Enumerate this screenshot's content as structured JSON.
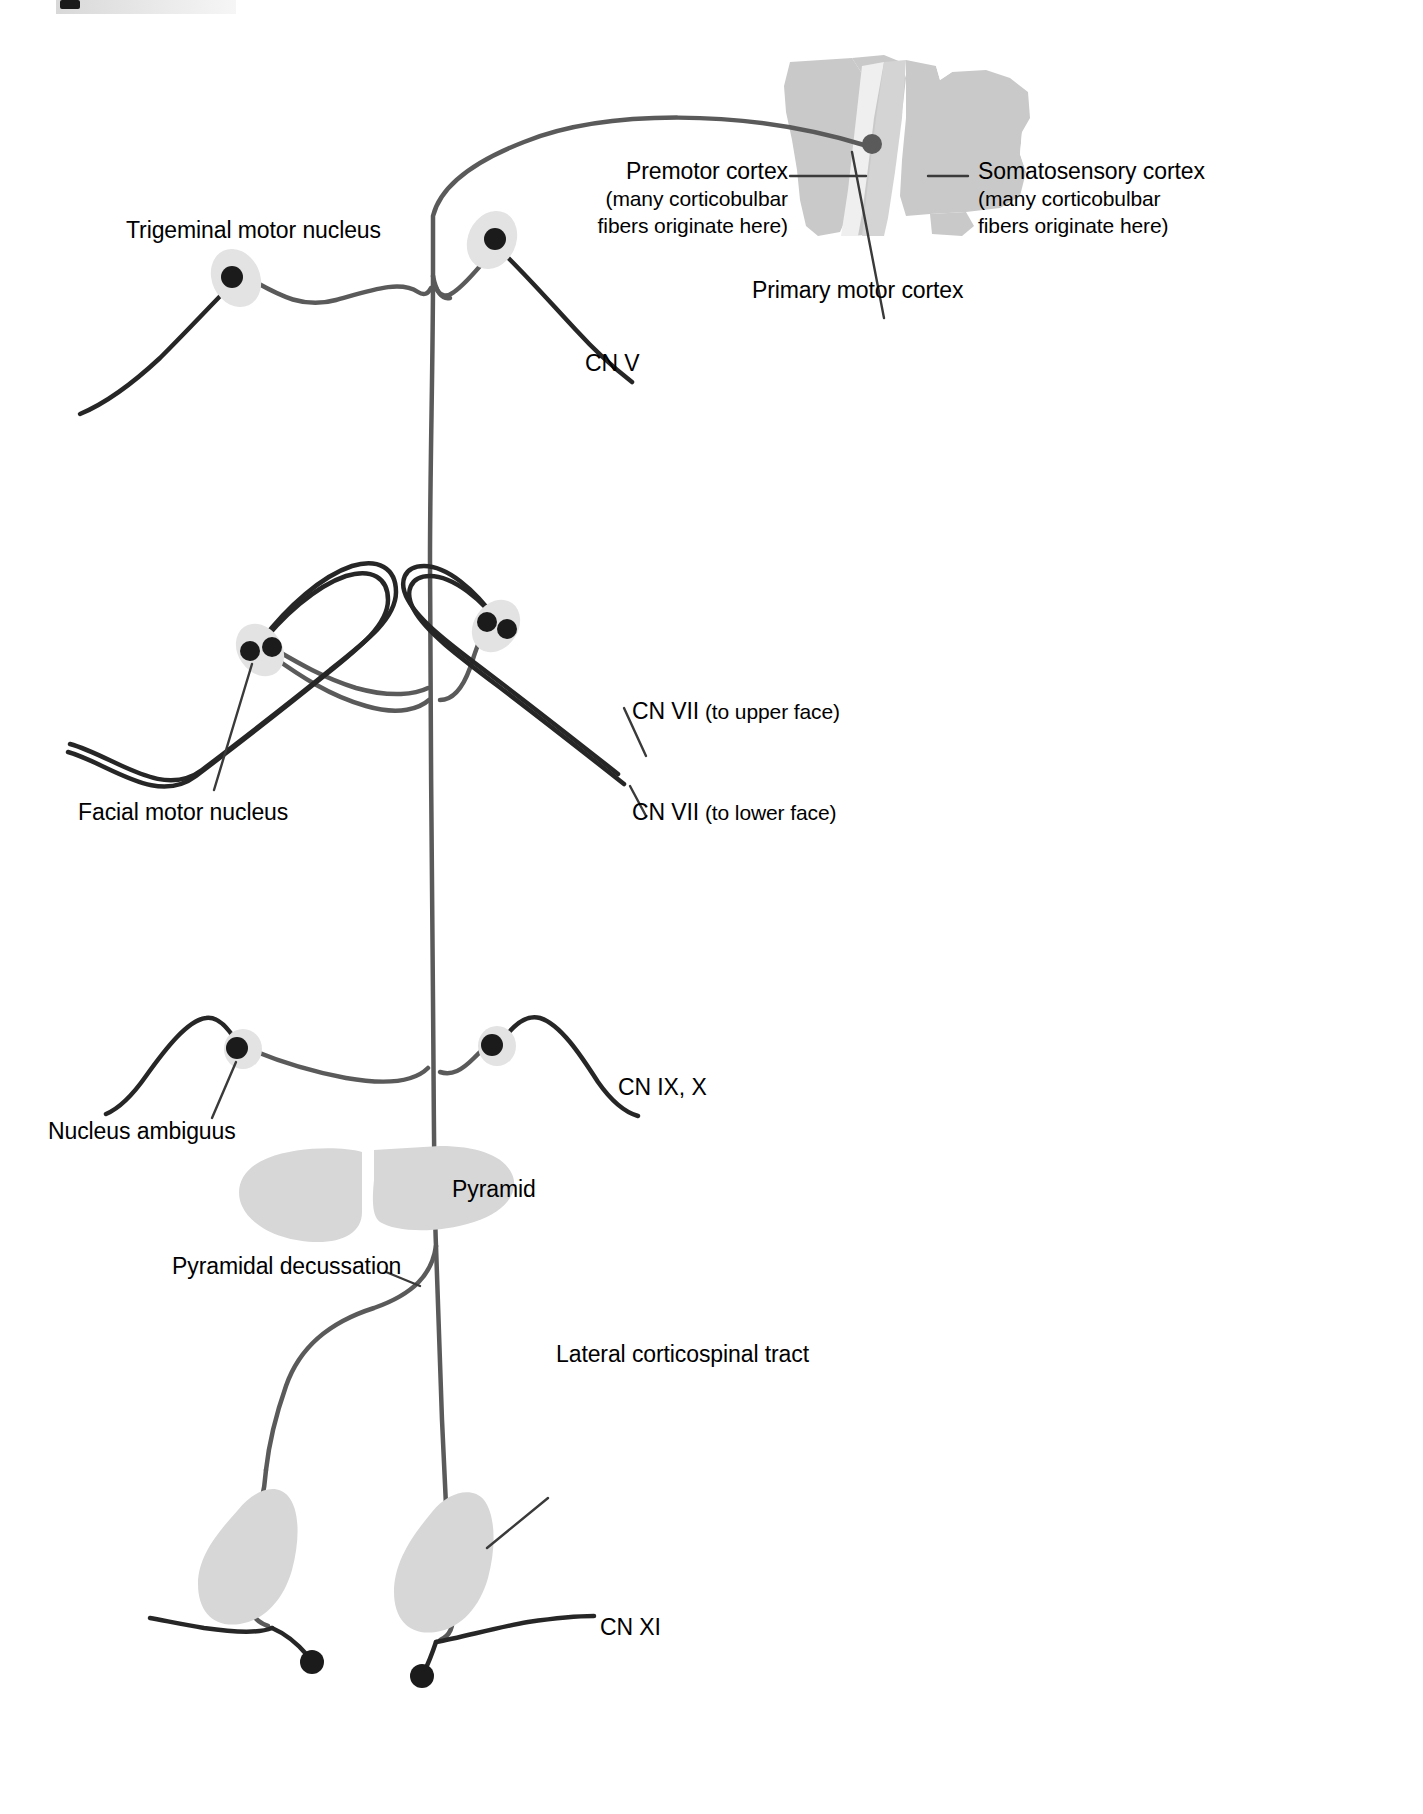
{
  "figure": {
    "background_color": "#ffffff",
    "width": 1423,
    "height": 1814
  },
  "colors": {
    "cortex_fill": "#c9c9c9",
    "cortex_fill_light": "#dedede",
    "nucleus_halo": "#e3e3e3",
    "pyramid_fill": "#d7d7d7",
    "upper_motor_neuron": "#5a5a5a",
    "lower_motor_neuron": "#262626",
    "leader_line": "#3a3a3a",
    "text": "#000000"
  },
  "labels": {
    "trigeminal_motor_nucleus": "Trigeminal motor nucleus",
    "premotor_cortex": "Premotor cortex",
    "premotor_cortex_note_line1": "(many corticobulbar",
    "premotor_cortex_note_line2": "fibers originate here)",
    "somatosensory_cortex": "Somatosensory cortex",
    "somatosensory_cortex_note_line1": "(many corticobulbar",
    "somatosensory_cortex_note_line2": "fibers originate here)",
    "primary_motor_cortex": "Primary motor cortex",
    "cn_v": "CN V",
    "cn_vii_upper_main": "CN VII",
    "cn_vii_upper_qualifier": "(to upper face)",
    "cn_vii_lower_main": "CN VII",
    "cn_vii_lower_qualifier": "(to lower face)",
    "facial_motor_nucleus": "Facial motor nucleus",
    "nucleus_ambiguus": "Nucleus ambiguus",
    "cn_ix_x": "CN IX, X",
    "pyramid": "Pyramid",
    "pyramidal_decussation": "Pyramidal decussation",
    "lateral_corticospinal_tract": "Lateral corticospinal tract",
    "cn_xi": "CN XI"
  },
  "structures": [
    {
      "name": "cerebral-cortex",
      "label": "Cerebral cortex block",
      "region": "top-right"
    },
    {
      "name": "premotor-cortex-region",
      "label": "Premotor cortex",
      "region": "cortex-anterior"
    },
    {
      "name": "primary-motor-cortex-region",
      "label": "Primary motor cortex",
      "region": "cortex-precentral-gyrus"
    },
    {
      "name": "somatosensory-cortex-region",
      "label": "Somatosensory cortex",
      "region": "cortex-postcentral-gyrus"
    },
    {
      "name": "trigeminal-motor-nucleus-left",
      "label": "Trigeminal motor nucleus",
      "side": "left"
    },
    {
      "name": "trigeminal-motor-nucleus-right",
      "label": "Trigeminal motor nucleus",
      "side": "right"
    },
    {
      "name": "facial-motor-nucleus-left",
      "label": "Facial motor nucleus",
      "side": "left"
    },
    {
      "name": "facial-motor-nucleus-right",
      "label": "Facial motor nucleus",
      "side": "right"
    },
    {
      "name": "nucleus-ambiguus-left",
      "label": "Nucleus ambiguus",
      "side": "left"
    },
    {
      "name": "nucleus-ambiguus-right",
      "label": "Nucleus ambiguus",
      "side": "right"
    },
    {
      "name": "pyramid-left",
      "label": "Pyramid",
      "side": "left"
    },
    {
      "name": "pyramid-right",
      "label": "Pyramid",
      "side": "right"
    },
    {
      "name": "lateral-corticospinal-tract-left",
      "label": "Lateral corticospinal tract",
      "side": "left"
    },
    {
      "name": "lateral-corticospinal-tract-right",
      "label": "Lateral corticospinal tract",
      "side": "right"
    }
  ],
  "nerves": [
    {
      "name": "cn-v",
      "label": "CN V",
      "target": "Trigeminal motor nucleus"
    },
    {
      "name": "cn-vii-upper",
      "label": "CN VII (to upper face)",
      "target": "Facial motor nucleus"
    },
    {
      "name": "cn-vii-lower",
      "label": "CN VII (to lower face)",
      "target": "Facial motor nucleus"
    },
    {
      "name": "cn-ix-x",
      "label": "CN IX, X",
      "target": "Nucleus ambiguus"
    },
    {
      "name": "cn-xi",
      "label": "CN XI",
      "target": "Spinal accessory nucleus"
    }
  ]
}
